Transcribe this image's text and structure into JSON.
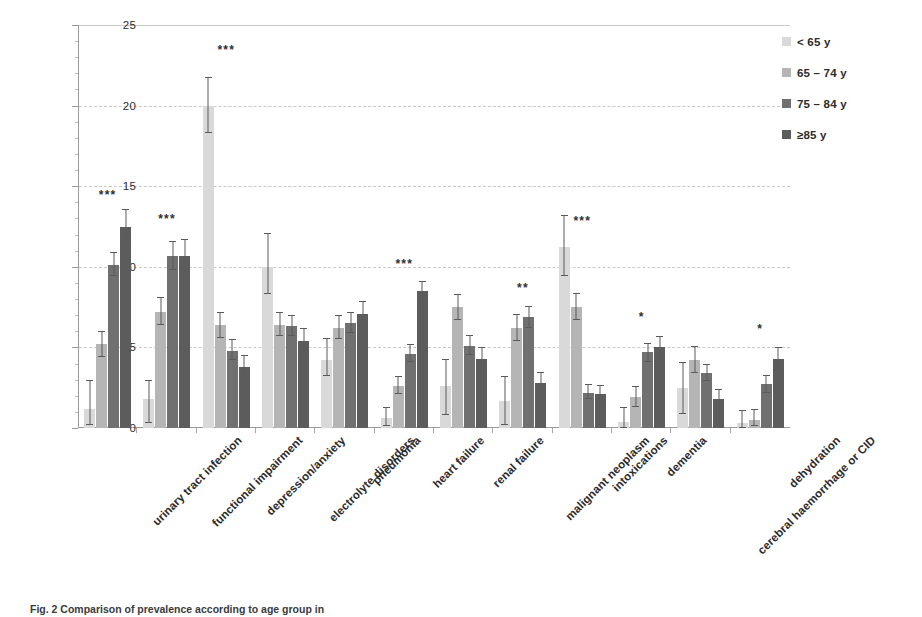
{
  "chart_data": {
    "type": "bar",
    "title": "",
    "xlabel": "",
    "ylabel": "prevalence (%)",
    "ylim": [
      0,
      25
    ],
    "yticks": [
      0,
      5,
      10,
      15,
      20,
      25
    ],
    "grid": true,
    "legend_position": "top-right",
    "categories": [
      "urinary tract infection",
      "functional impairment",
      "depression/anxiety",
      "electrolyte disorders",
      "pneumonia",
      "heart failure",
      "renal failure",
      "malignant neoplasm",
      "intoxications",
      "dementia",
      "cerebral haemorrhage or CID",
      "dehydration"
    ],
    "series": [
      {
        "name": "< 65 y",
        "color": "#d9d9d9",
        "values": [
          1.2,
          1.8,
          20.0,
          10.0,
          4.2,
          0.6,
          2.6,
          1.7,
          11.2,
          0.4,
          2.5,
          0.3
        ],
        "err_low": [
          0.2,
          0.3,
          18.3,
          8.3,
          3.2,
          0.1,
          0.8,
          0.2,
          9.4,
          0.0,
          0.9,
          0.0
        ],
        "err_high": [
          3.0,
          3.0,
          21.8,
          12.1,
          5.6,
          1.3,
          4.3,
          3.2,
          13.2,
          1.3,
          4.1,
          1.1
        ]
      },
      {
        "name": "65 – 74 y",
        "color": "#b5b5b5",
        "values": [
          5.2,
          7.2,
          6.4,
          6.4,
          6.2,
          2.6,
          7.5,
          6.2,
          7.5,
          1.9,
          4.2,
          0.5
        ],
        "err_low": [
          4.4,
          6.4,
          5.6,
          5.7,
          5.5,
          2.1,
          6.7,
          5.4,
          6.7,
          1.3,
          3.4,
          0.1
        ],
        "err_high": [
          6.0,
          8.1,
          7.2,
          7.2,
          7.0,
          3.2,
          8.3,
          7.1,
          8.4,
          2.6,
          5.1,
          1.2
        ]
      },
      {
        "name": "75 – 84 y",
        "color": "#707070",
        "values": [
          10.1,
          10.7,
          4.8,
          6.3,
          6.5,
          4.6,
          5.1,
          6.9,
          2.2,
          4.7,
          3.4,
          2.7
        ],
        "err_low": [
          9.4,
          9.8,
          4.2,
          5.7,
          5.9,
          4.1,
          4.5,
          6.2,
          1.8,
          4.1,
          2.9,
          2.2
        ],
        "err_high": [
          10.9,
          11.6,
          5.5,
          7.0,
          7.2,
          5.2,
          5.8,
          7.6,
          2.7,
          5.3,
          4.0,
          3.3
        ]
      },
      {
        "name": "≥85 y",
        "color": "#5c5c5c",
        "values": [
          12.5,
          10.7,
          3.8,
          5.4,
          7.1,
          8.5,
          4.3,
          2.8,
          2.1,
          5.0,
          1.8,
          4.3
        ],
        "err_low": [
          11.5,
          9.8,
          3.1,
          4.6,
          6.3,
          7.8,
          3.6,
          2.2,
          1.6,
          4.3,
          1.3,
          3.6
        ],
        "err_high": [
          13.6,
          11.7,
          4.5,
          6.2,
          7.9,
          9.1,
          5.0,
          3.5,
          2.7,
          5.7,
          2.4,
          5.0
        ]
      }
    ],
    "significance": [
      "***",
      "***",
      "***",
      "",
      "",
      "***",
      "",
      "**",
      "***",
      "*",
      "",
      "*"
    ],
    "significance_y": [
      14.1,
      12.6,
      23.1,
      0,
      0,
      9.8,
      0,
      8.3,
      12.5,
      6.5,
      0,
      5.8
    ]
  },
  "yaxis": {
    "title": "prevalence (%)",
    "ticks": [
      "0",
      "5",
      "10",
      "15",
      "20",
      "25"
    ]
  },
  "legend": {
    "items": [
      {
        "label": "< 65 y",
        "color": "#d9d9d9"
      },
      {
        "label": "65 – 74 y",
        "color": "#b5b5b5"
      },
      {
        "label": "75 – 84 y",
        "color": "#707070"
      },
      {
        "label": "≥85 y",
        "color": "#5c5c5c"
      }
    ]
  },
  "caption": {
    "text": "Fig. 2  Comparison of prevalence according to age group in"
  }
}
